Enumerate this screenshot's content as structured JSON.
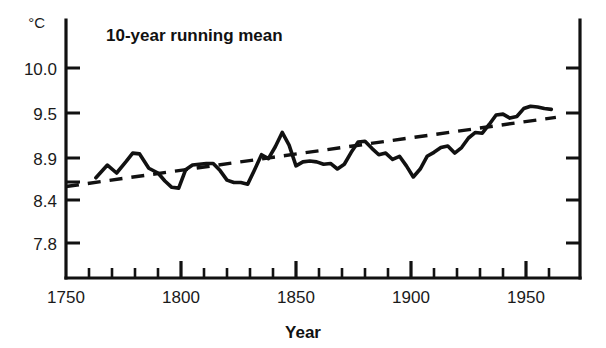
{
  "chart_data": {
    "type": "line",
    "title": "10-year running mean",
    "xlabel": "Year",
    "ylabel": "",
    "yunit": "°C",
    "xlim": [
      1750,
      1963
    ],
    "ylim": [
      7.55,
      10.35
    ],
    "grid": false,
    "legend_position": "none",
    "xticks_major": [
      1750,
      1800,
      1850,
      1900,
      1950
    ],
    "xtick_labels": [
      "1750",
      "1800",
      "1850",
      "1900",
      "1950"
    ],
    "xtick_minor_step": 10,
    "yticks": [
      7.8,
      8.4,
      8.9,
      9.5,
      10.0
    ],
    "ytick_labels": [
      "7.8",
      "8.4",
      "8.9",
      "9.5",
      "10.0"
    ],
    "series": [
      {
        "name": "10-year running mean",
        "style": "solid",
        "x": [
          1763,
          1768,
          1772,
          1776,
          1779,
          1782,
          1786,
          1790,
          1793,
          1796,
          1799,
          1802,
          1805,
          1808,
          1811,
          1814,
          1817,
          1820,
          1823,
          1826,
          1829,
          1832,
          1835,
          1838,
          1841,
          1844,
          1847,
          1850,
          1853,
          1856,
          1859,
          1862,
          1865,
          1868,
          1871,
          1874,
          1877,
          1880,
          1883,
          1886,
          1889,
          1892,
          1895,
          1898,
          1901,
          1904,
          1907,
          1910,
          1913,
          1916,
          1919,
          1922,
          1925,
          1928,
          1931,
          1934,
          1937,
          1940,
          1943,
          1946,
          1949,
          1952,
          1955,
          1958,
          1961
        ],
        "y": [
          8.62,
          8.78,
          8.68,
          8.82,
          8.93,
          8.92,
          8.74,
          8.68,
          8.58,
          8.5,
          8.49,
          8.72,
          8.78,
          8.79,
          8.8,
          8.8,
          8.71,
          8.59,
          8.56,
          8.56,
          8.54,
          8.72,
          8.91,
          8.86,
          9.01,
          9.19,
          9.03,
          8.77,
          8.82,
          8.83,
          8.82,
          8.79,
          8.8,
          8.73,
          8.79,
          8.94,
          9.07,
          9.08,
          8.99,
          8.91,
          8.93,
          8.85,
          8.89,
          8.77,
          8.63,
          8.73,
          8.89,
          8.94,
          9.0,
          9.02,
          8.93,
          9.0,
          9.12,
          9.19,
          9.18,
          9.29,
          9.41,
          9.42,
          9.37,
          9.39,
          9.49,
          9.52,
          9.51,
          9.49,
          9.48
        ]
      },
      {
        "name": "linear trend",
        "style": "dashed",
        "x": [
          1750,
          1963
        ],
        "y": [
          8.51,
          9.38
        ]
      }
    ]
  },
  "chart": {
    "title": "10-year running mean",
    "xaxis_title": "Year",
    "yaxis_unit": "°C",
    "colors": {
      "ink": "#111111",
      "background": "#ffffff"
    }
  }
}
